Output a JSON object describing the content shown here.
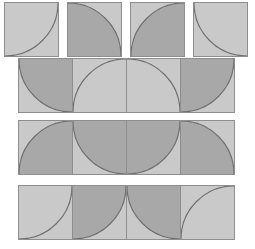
{
  "figure": {
    "type": "geometric-tiling",
    "canvas": {
      "width": 255,
      "height": 249,
      "background": "#ffffff"
    },
    "palette": {
      "tile_light": "#c9c9c9",
      "tile_dark": "#a8a8a8",
      "stroke": "#8e8e8e",
      "arc_stroke": "#6f6f6f"
    }
  },
  "bands": [
    {
      "name": "band-1",
      "separated": true,
      "x": 4,
      "y": 2,
      "tile": 55,
      "gap": 8,
      "tiles": [
        {
          "name": "tile-1-1",
          "corner": "top-left",
          "fill": "light"
        },
        {
          "name": "tile-1-2",
          "corner": "bottom-left",
          "fill": "dark"
        },
        {
          "name": "tile-1-3",
          "corner": "bottom-right",
          "fill": "dark"
        },
        {
          "name": "tile-1-4",
          "corner": "top-right",
          "fill": "light"
        }
      ]
    },
    {
      "name": "band-2",
      "separated": false,
      "x": 18,
      "y": 58,
      "tile": 55,
      "gap": 0,
      "tiles": [
        {
          "name": "tile-2-1",
          "corner": "top-right",
          "fill": "dark"
        },
        {
          "name": "tile-2-2",
          "corner": "bottom-right",
          "fill": "light"
        },
        {
          "name": "tile-2-3",
          "corner": "bottom-left",
          "fill": "light"
        },
        {
          "name": "tile-2-4",
          "corner": "top-left",
          "fill": "dark"
        }
      ]
    },
    {
      "name": "band-3",
      "separated": false,
      "x": 18,
      "y": 120,
      "tile": 55,
      "gap": 0,
      "tiles": [
        {
          "name": "tile-3-1",
          "corner": "bottom-right",
          "fill": "dark"
        },
        {
          "name": "tile-3-2",
          "corner": "top-right",
          "fill": "dark"
        },
        {
          "name": "tile-3-3",
          "corner": "top-left",
          "fill": "dark"
        },
        {
          "name": "tile-3-4",
          "corner": "bottom-left",
          "fill": "dark"
        }
      ]
    },
    {
      "name": "band-4",
      "separated": false,
      "x": 18,
      "y": 185,
      "tile": 55,
      "gap": 0,
      "tiles": [
        {
          "name": "tile-4-1",
          "corner": "top-left",
          "fill": "light"
        },
        {
          "name": "tile-4-2",
          "corner": "top-left",
          "fill": "dark"
        },
        {
          "name": "tile-4-3",
          "corner": "top-right",
          "fill": "dark"
        },
        {
          "name": "tile-4-4",
          "corner": "bottom-right",
          "fill": "light"
        }
      ]
    }
  ]
}
